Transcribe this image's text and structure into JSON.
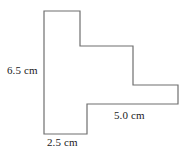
{
  "figure": {
    "kind": "geometry-diagram",
    "shape_name": "staircase-polygon",
    "background_color": "#ffffff",
    "stroke_color": "#6f6f6f",
    "stroke_width": 1.2,
    "fill_color": "none",
    "text_color": "#1a1a1a",
    "view_box": "0 0 192 156",
    "outline_path": "M 44 11 L 80 11 L 80 46 L 133 46 L 133 85 L 178 85 L 178 104 L 87 104 L 87 134 L 44 134 Z",
    "vertices": [
      [
        44,
        11
      ],
      [
        80,
        11
      ],
      [
        80,
        46
      ],
      [
        133,
        46
      ],
      [
        133,
        85
      ],
      [
        178,
        85
      ],
      [
        178,
        104
      ],
      [
        87,
        104
      ],
      [
        87,
        134
      ],
      [
        44,
        134
      ]
    ]
  },
  "labels": {
    "height": {
      "text": "6.5 cm",
      "value": 6.5,
      "unit": "cm",
      "edge": "left-vertical"
    },
    "right": {
      "text": "5.0 cm",
      "value": 5.0,
      "unit": "cm",
      "edge": "lower-right-horizontal"
    },
    "bottom": {
      "text": "2.5 cm",
      "value": 2.5,
      "unit": "cm",
      "edge": "bottom-horizontal"
    }
  }
}
